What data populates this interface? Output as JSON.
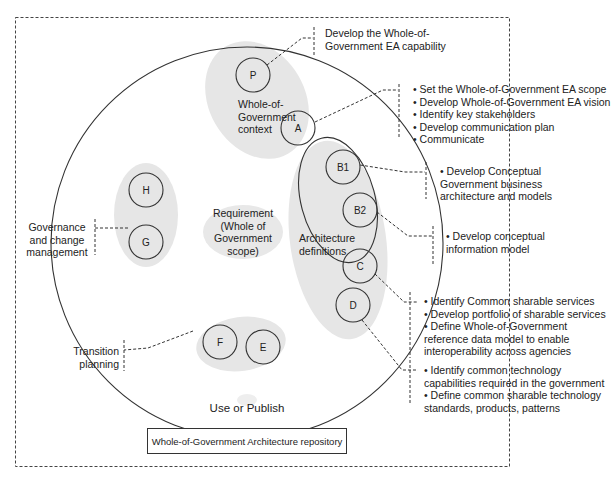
{
  "nodes": {
    "P": "P",
    "A": "A",
    "B1": "B1",
    "B2": "B2",
    "C": "C",
    "D": "D",
    "E": "E",
    "F": "F",
    "G": "G",
    "H": "H"
  },
  "groups": {
    "context": "Whole-of-Government context",
    "context_lines": [
      "Whole-of-",
      "Government",
      "context"
    ],
    "requirement_lines": [
      "Requirement",
      "(Whole of",
      "Government",
      "scope)"
    ],
    "architecture_lines": [
      "Architecture",
      "definitions"
    ],
    "governance_lines": [
      "Governance",
      "and change",
      "management"
    ],
    "transition_lines": [
      "Transition",
      "planning"
    ]
  },
  "annotations": {
    "P": [
      "Develop the Whole-of-",
      "Government EA capability"
    ],
    "A": [
      "• Set the Whole-of-Government EA scope",
      "• Develop Whole-of-Government EA vision",
      "• Identify key stakeholders",
      "• Develop communication plan",
      "• Communicate"
    ],
    "B1": [
      "• Develop Conceptual",
      "Government business",
      "architecture and models"
    ],
    "B2": [
      "• Develop conceptual",
      "information model"
    ],
    "C": [
      "• Identify Common sharable services",
      "• Develop portfolio of sharable services",
      "• Define Whole-of-Government",
      "reference data model to enable",
      "interoperability across agencies"
    ],
    "D": [
      "• Identify common technology",
      "capabilities required in the government",
      "• Define common sharable technology",
      "standards, products, patterns"
    ]
  },
  "use_or_publish": "Use or Publish",
  "repository": "Whole-of-Government Architecture repository",
  "colors": {
    "shade": "#e6e6e6",
    "line": "#333333",
    "text": "#222222"
  }
}
